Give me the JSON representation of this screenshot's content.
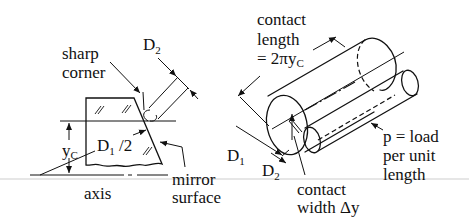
{
  "figure": {
    "left_panel": {
      "labels": {
        "sharp_corner_line1": "sharp",
        "sharp_corner_line2": "corner",
        "d2_main": "D",
        "d2_sub": "2",
        "yc_main": "y",
        "yc_sub": "C",
        "d1_half_main": "D",
        "d1_half_sub": "1",
        "d1_half_suffix": " /2",
        "axis": "axis",
        "mirror_surface_line1": "mirror",
        "mirror_surface_line2": "surface"
      }
    },
    "right_panel": {
      "labels": {
        "contact_length_line1": "contact",
        "contact_length_line2": "length",
        "contact_length_line3_prefix": "= 2πy",
        "contact_length_line3_sub": "C",
        "d1_main": "D",
        "d1_sub": "1",
        "d2_main": "D",
        "d2_sub": "2",
        "contact_width_line1": "contact",
        "contact_width_line2": "width Δy",
        "load_line1": "p = load",
        "load_line2": "per unit",
        "load_line3": "length"
      }
    },
    "colors": {
      "ink": "#111111",
      "background": "#ffffff"
    }
  }
}
